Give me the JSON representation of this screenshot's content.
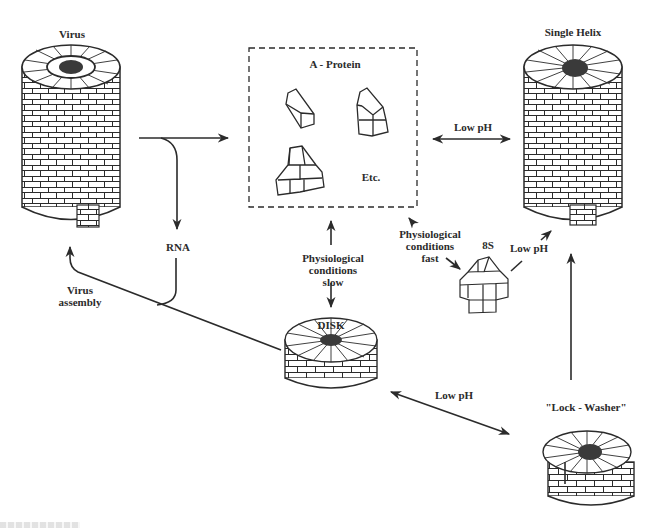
{
  "diagram": {
    "type": "state-transition diagram",
    "nodes": [
      {
        "id": "virus",
        "label": "Virus",
        "shape": "tall helical cylinder with RNA core"
      },
      {
        "id": "a_protein",
        "label": "A - Protein",
        "shape": "dashed box with small protein subunit wedges",
        "extra_text": "Etc."
      },
      {
        "id": "single_helix",
        "label": "Single Helix",
        "shape": "tall helical cylinder"
      },
      {
        "id": "rna",
        "label": "RNA"
      },
      {
        "id": "disk",
        "label": "DISK",
        "shape": "two-layer disk"
      },
      {
        "id": "8s",
        "label": "8S",
        "shape": "small partial aggregate"
      },
      {
        "id": "lock_washer",
        "label": "\"Lock - Washer\"",
        "shape": "split-ring disk"
      }
    ],
    "edges": [
      {
        "from": "virus",
        "to": "a_protein",
        "label": "",
        "direction": "forward",
        "branch": "rna"
      },
      {
        "from": "a_protein",
        "to": "single_helix",
        "label": "Low pH",
        "direction": "both"
      },
      {
        "from": "a_protein",
        "to": "disk",
        "label": "Physiological conditions slow",
        "direction": "both"
      },
      {
        "from": "a_protein",
        "to": "8s",
        "label": "Physiological conditions fast",
        "direction": "both"
      },
      {
        "from": "8s",
        "to": "single_helix",
        "label": "Low pH",
        "direction": "forward"
      },
      {
        "from": "disk",
        "to": "lock_washer",
        "label": "Low pH",
        "direction": "both"
      },
      {
        "from": "lock_washer",
        "to": "single_helix",
        "label": "",
        "direction": "forward"
      },
      {
        "from": "disk",
        "to": "virus",
        "label": "Virus assembly",
        "direction": "forward",
        "joins": "rna"
      }
    ]
  },
  "labels": {
    "virus": "Virus",
    "a_protein": "A - Protein",
    "etc": "Etc.",
    "single_helix": "Single Helix",
    "low_ph_top": "Low pH",
    "rna": "RNA",
    "phys_slow": "Physiological\nconditions\nslow",
    "phys_fast": "Physiological\nconditions\nfast",
    "s8": "8S",
    "low_ph_8s": "Low pH",
    "virus_assembly": "Virus\nassembly",
    "disk": "DISK",
    "low_ph_bottom": "Low pH",
    "lock_washer": "\"Lock - Washer\""
  },
  "colors": {
    "ink": "#2b2b2b",
    "core": "#3a3a3a",
    "background": "#ffffff"
  }
}
